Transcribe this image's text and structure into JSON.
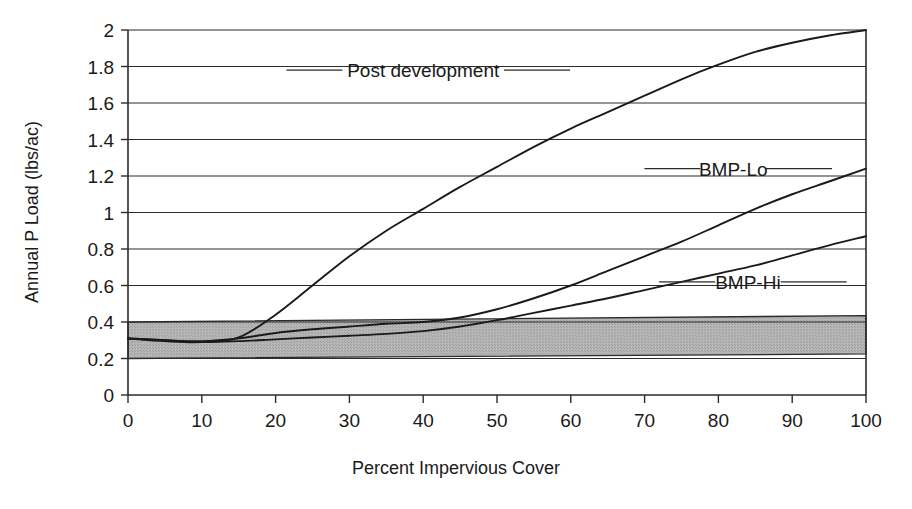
{
  "chart_data": {
    "type": "line",
    "title": "",
    "xlabel": "Percent Impervious Cover",
    "ylabel": "Annual P Load (lbs/ac)",
    "xlim": [
      0,
      100
    ],
    "ylim": [
      0,
      2
    ],
    "xticks": [
      "0",
      "10",
      "20",
      "30",
      "40",
      "50",
      "60",
      "70",
      "80",
      "90",
      "100"
    ],
    "yticks": [
      "0",
      "0.2",
      "0.4",
      "0.6",
      "0.8",
      "1",
      "1.2",
      "1.4",
      "1.6",
      "1.8",
      "2"
    ],
    "grid": "horizontal",
    "legend_position": "inline-right-labels",
    "x": [
      0,
      5,
      10,
      15,
      20,
      25,
      30,
      35,
      40,
      45,
      50,
      55,
      60,
      65,
      70,
      75,
      80,
      85,
      90,
      95,
      100
    ],
    "series": [
      {
        "name": "Post development",
        "label": "Post development",
        "values": [
          0.31,
          0.295,
          0.29,
          0.315,
          0.44,
          0.6,
          0.76,
          0.9,
          1.02,
          1.14,
          1.25,
          1.36,
          1.46,
          1.55,
          1.64,
          1.73,
          1.81,
          1.88,
          1.93,
          1.97,
          2.0
        ],
        "label_x": 40,
        "label_y": 1.78
      },
      {
        "name": "BMP-Lo",
        "label": "BMP-Lo",
        "values": [
          0.31,
          0.3,
          0.295,
          0.31,
          0.34,
          0.36,
          0.375,
          0.39,
          0.4,
          0.425,
          0.47,
          0.53,
          0.6,
          0.68,
          0.76,
          0.84,
          0.93,
          1.02,
          1.1,
          1.17,
          1.24
        ],
        "label_x": 82,
        "label_y": 1.24
      },
      {
        "name": "BMP-Hi",
        "label": "BMP-Hi",
        "values": [
          0.31,
          0.3,
          0.29,
          0.295,
          0.305,
          0.315,
          0.325,
          0.335,
          0.35,
          0.375,
          0.41,
          0.45,
          0.49,
          0.53,
          0.575,
          0.62,
          0.665,
          0.71,
          0.765,
          0.82,
          0.87
        ],
        "label_x": 84,
        "label_y": 0.62
      }
    ],
    "shaded_band": {
      "name": "pre-development range band",
      "color": "#b0b0b0",
      "lower_left": 0.2,
      "upper_left": 0.4,
      "lower_right": 0.225,
      "upper_right": 0.435
    }
  },
  "colors": {
    "line": "#1a1a1a",
    "grid": "#2b2b2b",
    "band": "#b0b0b0",
    "background": "#ffffff"
  }
}
